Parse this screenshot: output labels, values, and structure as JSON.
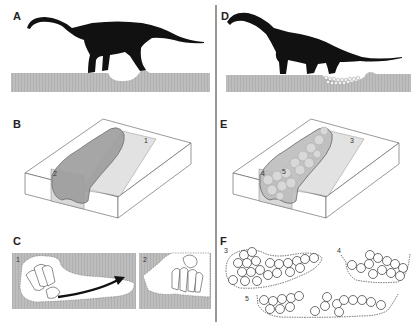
{
  "figure": {
    "divider_color": "#555555",
    "ground_color": "#b8b8b8",
    "silhouette_color": "#111111",
    "panels": [
      {
        "id": "A",
        "label": "A",
        "description": "Sauropod digging a nest hole with hind foot"
      },
      {
        "id": "B",
        "label": "B",
        "description": "Block diagram of excavated nest cavity",
        "section_labels": [
          "1",
          "2"
        ]
      },
      {
        "id": "C",
        "label": "C",
        "description": "Sections 1 and 2 showing foot scraping movement",
        "section_labels": [
          "1",
          "2"
        ]
      },
      {
        "id": "D",
        "label": "D",
        "description": "Sauropod with egg clutch deposited in ground hollow"
      },
      {
        "id": "E",
        "label": "E",
        "description": "Block diagram of nest cavity filled with eggs",
        "section_labels": [
          "3",
          "4",
          "5"
        ]
      },
      {
        "id": "F",
        "label": "F",
        "description": "Cross sections 3, 4 and 5 of egg clutch",
        "section_labels": [
          "3",
          "4",
          "5"
        ]
      }
    ]
  }
}
